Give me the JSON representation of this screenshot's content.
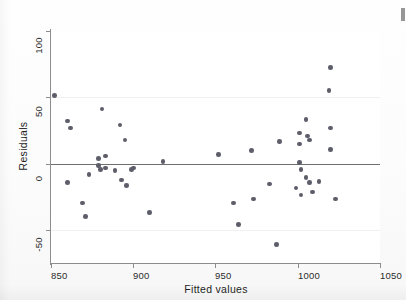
{
  "figure": {
    "kind": "scatter-plot",
    "background_color": "#ffffff",
    "point_color": "#5e5e6b",
    "axis_color": "#8d8d8d",
    "zero_line_color": "#6f6f6f"
  },
  "axes": {
    "y_title": "Residuals",
    "x_title": "Fitted values",
    "y_ticks": [
      "100",
      "50",
      "0",
      "-50"
    ],
    "x_ticks": [
      "850",
      "900",
      "950",
      "1000",
      "1050"
    ]
  },
  "chart_data": {
    "type": "scatter",
    "title": "",
    "xlabel": "Fitted values",
    "ylabel": "Residuals",
    "xlim": [
      850,
      1050
    ],
    "ylim": [
      -62,
      100
    ],
    "x_ticks": [
      850,
      900,
      950,
      1000,
      1050
    ],
    "y_ticks": [
      -50,
      0,
      50,
      100
    ],
    "grid": false,
    "reference_line": {
      "orientation": "horizontal",
      "y": 0
    },
    "legend": null,
    "marker": {
      "shape": "circle",
      "color": "#5e5e6b",
      "size": 4.6
    },
    "series": [
      {
        "name": "residuals",
        "points": [
          [
            852,
            51
          ],
          [
            860,
            32
          ],
          [
            862,
            27
          ],
          [
            860,
            -14
          ],
          [
            869,
            -29
          ],
          [
            871,
            -39
          ],
          [
            873,
            -8
          ],
          [
            879,
            4
          ],
          [
            879,
            -1
          ],
          [
            880,
            -4
          ],
          [
            881,
            41
          ],
          [
            883,
            6
          ],
          [
            883,
            -3
          ],
          [
            889,
            -5
          ],
          [
            892,
            29
          ],
          [
            893,
            -12
          ],
          [
            895,
            18
          ],
          [
            896,
            -16
          ],
          [
            899,
            -4
          ],
          [
            900,
            -3
          ],
          [
            910,
            -36
          ],
          [
            918,
            2
          ],
          [
            952,
            7
          ],
          [
            961,
            -29
          ],
          [
            964,
            -45
          ],
          [
            972,
            10
          ],
          [
            973,
            -26
          ],
          [
            983,
            -15
          ],
          [
            987,
            -60
          ],
          [
            989,
            17
          ],
          [
            999,
            -18
          ],
          [
            1001,
            23
          ],
          [
            1001,
            15
          ],
          [
            1001,
            1
          ],
          [
            1002,
            -4
          ],
          [
            1002,
            -23
          ],
          [
            1005,
            33
          ],
          [
            1005,
            -10
          ],
          [
            1006,
            21
          ],
          [
            1007,
            18
          ],
          [
            1007,
            -14
          ],
          [
            1009,
            -21
          ],
          [
            1013,
            -13
          ],
          [
            1019,
            55
          ],
          [
            1020,
            72
          ],
          [
            1020,
            27
          ],
          [
            1020,
            11
          ],
          [
            1023,
            -26
          ]
        ]
      }
    ]
  }
}
